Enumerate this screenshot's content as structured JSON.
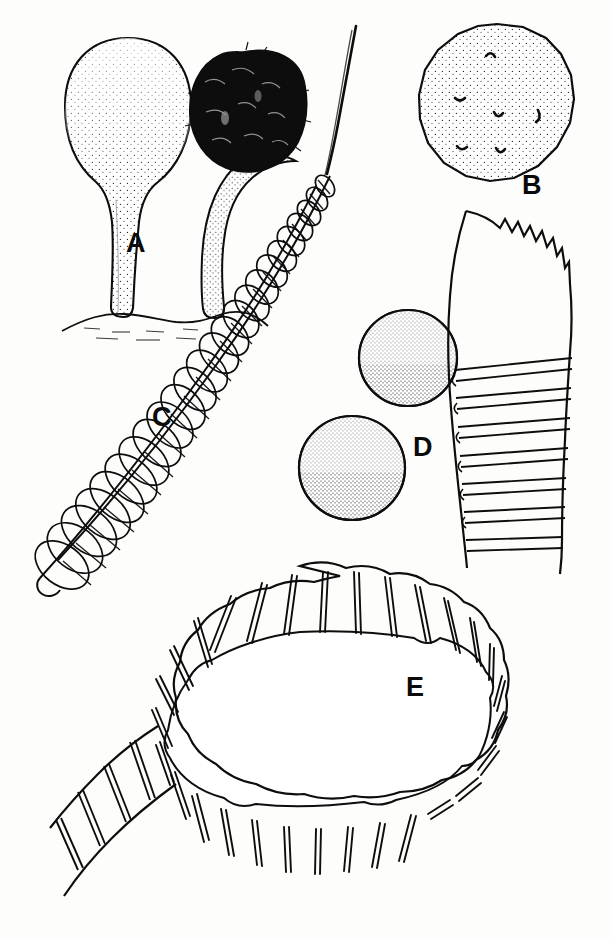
{
  "plate": {
    "title": "Morphological plate of sporangia, spores and elaters",
    "background_color": "#fdfdfc",
    "ink_color": "#0d0d0d",
    "fill_color": "#ffffff",
    "dark_fill_color": "#0d0d0d",
    "stipple_color": "#1a1a1a",
    "width": 611,
    "height": 939
  },
  "labels": [
    {
      "id": "A",
      "text": "A",
      "x": 126,
      "y": 230,
      "describes": "two stalked sporangia on substrate, one immature stippled and one mature with dark capillitium mass"
    },
    {
      "id": "B",
      "text": "B",
      "x": 522,
      "y": 172,
      "describes": "single polygonal stippled spore with small curved surface marks"
    },
    {
      "id": "C",
      "text": "C",
      "x": 152,
      "y": 404,
      "describes": "helical spiral elater tapering to a fine point"
    },
    {
      "id": "D",
      "text": "D",
      "x": 413,
      "y": 434,
      "describes": "two circular stippled spores"
    },
    {
      "id": "E",
      "text": "E",
      "x": 406,
      "y": 674,
      "describes": "large annular thickened tracheid tube looped into a ring with serrate margin"
    }
  ],
  "figures": {
    "A": {
      "label": "A",
      "element_count": 2,
      "parts": [
        "immature sporangium",
        "mature sporangium",
        "stalk",
        "substrate line",
        "hypothallus"
      ],
      "immature": {
        "head_cx": 128,
        "head_cy": 108,
        "head_rx": 62,
        "head_ry": 72,
        "stalk_base_x": 112,
        "stalk_base_y": 318
      },
      "mature": {
        "head_cx": 243,
        "head_cy": 110,
        "head_rx": 58,
        "head_ry": 56,
        "stalk_base_x": 216,
        "stalk_base_y": 318
      },
      "substrate_y": 318
    },
    "B": {
      "label": "B",
      "element_count": 1,
      "parts": [
        "spore wall",
        "stipple ornamentation",
        "curved surface marks"
      ],
      "cx": 497,
      "cy": 103,
      "rx": 76,
      "ry": 79,
      "mark_count": 6
    },
    "C": {
      "label": "C",
      "element_count": 1,
      "parts": [
        "spiral band",
        "tapering apex",
        "coil"
      ],
      "apex_x": 355,
      "apex_y": 26,
      "base_x": 48,
      "base_y": 600,
      "coil_count": 30
    },
    "D": {
      "label": "D",
      "element_count": 2,
      "parts": [
        "spore wall",
        "stipple ornamentation"
      ],
      "spore_upper": {
        "cx": 408,
        "cy": 358,
        "rx": 48,
        "ry": 48
      },
      "spore_lower": {
        "cx": 352,
        "cy": 468,
        "rx": 52,
        "ry": 52
      }
    },
    "E": {
      "label": "E",
      "element_count": 1,
      "parts": [
        "annular thickenings",
        "serrate margin",
        "tube wall",
        "looped ring"
      ],
      "ring_cx": 300,
      "ring_cy": 735,
      "ring_rx": 210,
      "ring_ry": 135,
      "tail_top_x": 465,
      "tail_top_y": 210,
      "annulus_count": 46
    }
  }
}
